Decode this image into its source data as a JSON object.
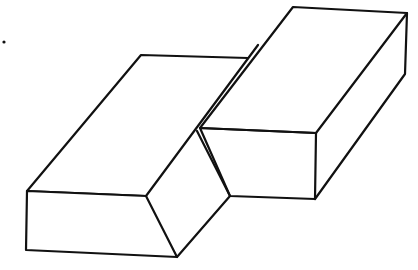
{
  "figure": {
    "stroke_color": "#111111",
    "background_color": "#ffffff",
    "dot": {
      "x": 4,
      "y": 42
    },
    "left_block": {
      "top_face": [
        [
          27,
          191
        ],
        [
          141,
          55
        ],
        [
          248,
          58
        ],
        [
          146,
          196
        ]
      ],
      "front_face": [
        [
          27,
          191
        ],
        [
          146,
          196
        ],
        [
          177,
          257
        ],
        [
          26,
          250
        ]
      ]
    },
    "slant_face": [
      [
        146,
        196
      ],
      [
        197,
        131
      ],
      [
        230,
        196
      ],
      [
        177,
        257
      ]
    ],
    "right_block": {
      "top_face": [
        [
          200,
          128
        ],
        [
          293,
          7
        ],
        [
          407,
          13
        ],
        [
          316,
          133
        ]
      ],
      "front_face": [
        [
          200,
          128
        ],
        [
          316,
          133
        ],
        [
          315,
          199
        ],
        [
          230,
          196
        ]
      ],
      "side_face": [
        [
          316,
          133
        ],
        [
          407,
          13
        ],
        [
          405,
          74
        ],
        [
          315,
          199
        ]
      ]
    }
  }
}
